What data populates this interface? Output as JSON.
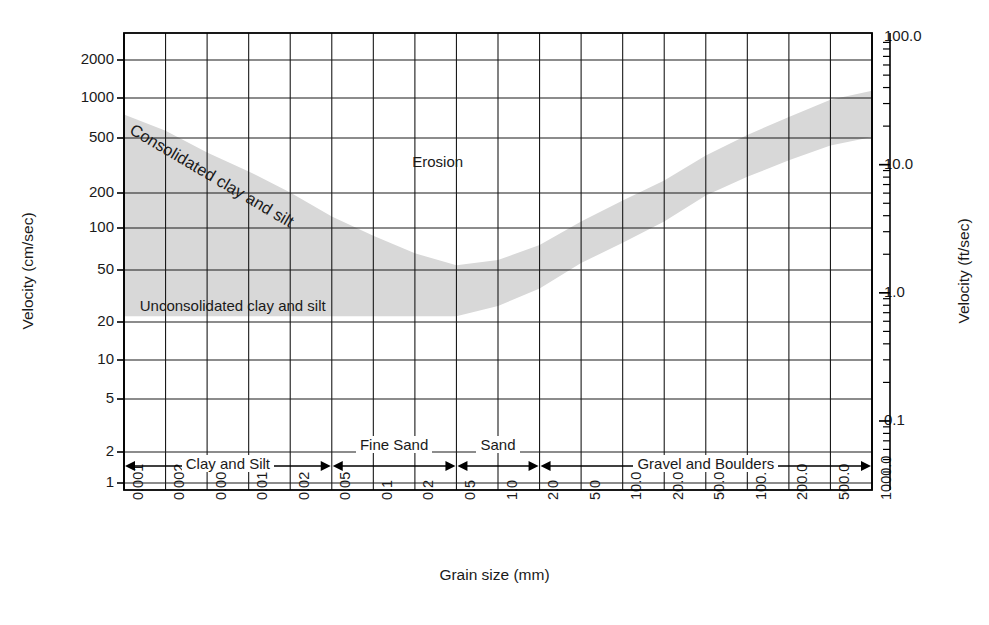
{
  "chart_data": {
    "type": "area",
    "title": "",
    "xlabel": "Grain size (mm)",
    "ylabel": "Velocity (cm/sec)",
    "ylabel_right": "Velocity (ft/sec)",
    "xscale": "log",
    "yscale": "log",
    "xlim": [
      0.001,
      1000.0
    ],
    "ylim": [
      1,
      3000
    ],
    "xticks": [
      "0.001",
      "0.002",
      "0.005",
      "0.01",
      "0.02",
      "0.05",
      "0.1",
      "0.2",
      "0.5",
      "1.0",
      "2.0",
      "5.0",
      "10.0",
      "20.0",
      "50.0",
      "100.0",
      "200.0",
      "500.0",
      "1000.0"
    ],
    "yticks_left": [
      "2000",
      "1000",
      "500",
      "200",
      "100",
      "50",
      "20",
      "10",
      "5",
      "2",
      "1"
    ],
    "yticks_right": [
      "100.0",
      "10.0",
      "1.0",
      "0.1"
    ],
    "grid": true,
    "legend_position": "none",
    "annotations": [
      {
        "name": "erosion",
        "text": "Erosion"
      },
      {
        "name": "consolidated",
        "text": "Consolidated clay and silt"
      },
      {
        "name": "unconsolidated",
        "text": "Unconsolidated clay and silt"
      }
    ],
    "series": [
      {
        "name": "Critical erosion velocity envelope (upper boundary)",
        "points": [
          {
            "x": 0.001,
            "y": 750
          },
          {
            "x": 0.002,
            "y": 560
          },
          {
            "x": 0.005,
            "y": 380
          },
          {
            "x": 0.01,
            "y": 270
          },
          {
            "x": 0.02,
            "y": 185
          },
          {
            "x": 0.05,
            "y": 120
          },
          {
            "x": 0.1,
            "y": 85
          },
          {
            "x": 0.2,
            "y": 62
          },
          {
            "x": 0.5,
            "y": 50
          },
          {
            "x": 1.0,
            "y": 55
          },
          {
            "x": 2.0,
            "y": 72
          },
          {
            "x": 5.0,
            "y": 110
          },
          {
            "x": 10.0,
            "y": 160
          },
          {
            "x": 20.0,
            "y": 230
          },
          {
            "x": 50.0,
            "y": 360
          },
          {
            "x": 100.0,
            "y": 520
          },
          {
            "x": 200.0,
            "y": 720
          },
          {
            "x": 500.0,
            "y": 980
          },
          {
            "x": 1000.0,
            "y": 1150
          }
        ]
      },
      {
        "name": "Critical erosion velocity envelope (lower boundary)",
        "points": [
          {
            "x": 0.001,
            "y": 20
          },
          {
            "x": 0.05,
            "y": 20
          },
          {
            "x": 0.1,
            "y": 20
          },
          {
            "x": 0.2,
            "y": 20
          },
          {
            "x": 0.5,
            "y": 20
          },
          {
            "x": 1.0,
            "y": 24
          },
          {
            "x": 2.0,
            "y": 33
          },
          {
            "x": 5.0,
            "y": 52
          },
          {
            "x": 10.0,
            "y": 75
          },
          {
            "x": 20.0,
            "y": 110
          },
          {
            "x": 50.0,
            "y": 175
          },
          {
            "x": 100.0,
            "y": 245
          },
          {
            "x": 200.0,
            "y": 330
          },
          {
            "x": 500.0,
            "y": 430
          },
          {
            "x": 1000.0,
            "y": 500
          }
        ]
      }
    ],
    "grain_classes": [
      {
        "label": "Clay and Silt",
        "from": 0.001,
        "to": 0.05
      },
      {
        "label": "Fine Sand",
        "from": 0.05,
        "to": 0.5
      },
      {
        "label": "Sand",
        "from": 0.5,
        "to": 2.0
      },
      {
        "label": "Gravel and Boulders",
        "from": 2.0,
        "to": 1000.0
      }
    ],
    "colors": {
      "band_fill": "#d8d8d8",
      "grid": "#1a1a1a",
      "axis": "#000000",
      "text": "#1a1a1a",
      "background": "#ffffff"
    }
  },
  "axes": {
    "left_title": "Velocity (cm/sec)",
    "right_title": "Velocity (ft/sec)",
    "bottom_title": "Grain size (mm)"
  },
  "labels": {
    "erosion": "Erosion",
    "consolidated": "Consolidated clay and silt",
    "unconsolidated": "Unconsolidated clay and silt"
  }
}
